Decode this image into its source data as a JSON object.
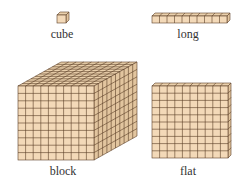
{
  "colors": {
    "fill": "#f3d9b8",
    "fill_top": "#ead0ac",
    "fill_side": "#e2c59f",
    "line": "#5a3e26",
    "text": "#333333"
  },
  "pieces": [
    {
      "id": "cube",
      "label": "cube",
      "units": 1
    },
    {
      "id": "long",
      "label": "long",
      "units": 10
    },
    {
      "id": "block",
      "label": "block",
      "units": 1000
    },
    {
      "id": "flat",
      "label": "flat",
      "units": 100
    }
  ]
}
